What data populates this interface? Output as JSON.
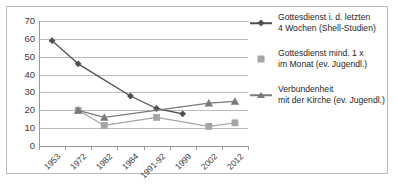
{
  "chart_data": {
    "type": "line",
    "title": "",
    "subtitle": "",
    "xlabel": "",
    "ylabel": "",
    "categories": [
      "1953",
      "1972",
      "1982",
      "1984",
      "1991-92",
      "1999",
      "2002",
      "2012"
    ],
    "ylim": [
      0,
      70
    ],
    "ytick_labels": [
      "0",
      "10",
      "20",
      "30",
      "40",
      "50",
      "60",
      "70"
    ],
    "ytick_values": [
      0,
      10,
      20,
      30,
      40,
      50,
      60,
      70
    ],
    "grid": true,
    "legend_position": "right",
    "series": [
      {
        "name": "Gottesdienst i. d. letzten 4 Wochen (Shell-Studien)",
        "label_line_1": "Gottesdienst i. d. letzten",
        "label_line_2": "4 Wochen (Shell-Studien)",
        "color": "#4f4f4f",
        "marker": "diamond",
        "points": [
          {
            "x": "1953",
            "y": 59
          },
          {
            "x": "1972",
            "y": 46
          },
          {
            "x": "1984",
            "y": 28
          },
          {
            "x": "1991-92",
            "y": 21
          },
          {
            "x": "1999",
            "y": 18
          }
        ]
      },
      {
        "name": "Gottesdienst mind. 1 x im Monat (ev. Jugendl.)",
        "label_line_1": "Gottesdienst mind. 1 x",
        "label_line_2": "im Monat (ev. Jugendl.)",
        "color": "#a6a6a6",
        "marker": "square",
        "points": [
          {
            "x": "1972",
            "y": 20
          },
          {
            "x": "1982",
            "y": 11.5
          },
          {
            "x": "1991-92",
            "y": 16
          },
          {
            "x": "2002",
            "y": 11
          },
          {
            "x": "2012",
            "y": 13
          }
        ]
      },
      {
        "name": "Verbundenheit mit der Kirche (ev. Jugendl.)",
        "label_line_1": "Verbundenheit",
        "label_line_2": "mit der Kirche (ev. Jugendl.)",
        "color": "#7a7a7a",
        "marker": "triangle",
        "points": [
          {
            "x": "1972",
            "y": 20
          },
          {
            "x": "1982",
            "y": 16
          },
          {
            "x": "2002",
            "y": 24
          },
          {
            "x": "2012",
            "y": 25
          }
        ]
      }
    ]
  },
  "colors": {
    "grid": "#bdbdbd",
    "axis": "#9a9a9a",
    "frame": "#b9b9b9",
    "text": "#3b3b3b",
    "background": "#ffffff"
  }
}
